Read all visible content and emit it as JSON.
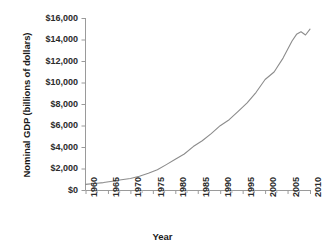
{
  "chart_data": {
    "type": "line",
    "title": "",
    "xlabel": "Year",
    "ylabel": "Nominal GDP (billions of dollars)",
    "xlim": [
      1960,
      2010
    ],
    "ylim": [
      0,
      16000
    ],
    "grid": false,
    "legend": null,
    "line_color": "#8c8c8c",
    "x_tick_labels": [
      "1960",
      "1965",
      "1970",
      "1975",
      "1980",
      "1985",
      "1990",
      "1995",
      "2000",
      "2005",
      "2010"
    ],
    "y_tick_labels": [
      "$0",
      "$2,000",
      "$4,000",
      "$6,000",
      "$8,000",
      "$10,000",
      "$12,000",
      "$14,000",
      "$16,000"
    ],
    "y_tick_values": [
      0,
      2000,
      4000,
      6000,
      8000,
      10000,
      12000,
      14000,
      16000
    ],
    "x": [
      1960,
      1962,
      1964,
      1966,
      1968,
      1970,
      1972,
      1974,
      1976,
      1978,
      1980,
      1982,
      1984,
      1986,
      1988,
      1990,
      1992,
      1994,
      1996,
      1998,
      2000,
      2002,
      2004,
      2006,
      2007,
      2008,
      2009,
      2010
    ],
    "series": [
      {
        "name": "Nominal GDP",
        "values": [
          520,
          600,
          690,
          820,
          950,
          1070,
          1280,
          1550,
          1880,
          2360,
          2860,
          3350,
          4040,
          4580,
          5250,
          5980,
          6540,
          7310,
          8100,
          9090,
          10280,
          10980,
          12270,
          13860,
          14480,
          14720,
          14420,
          14960
        ]
      }
    ]
  },
  "axis": {
    "x_title": "Year",
    "y_title": "Nominal GDP (billions of dollars)"
  }
}
